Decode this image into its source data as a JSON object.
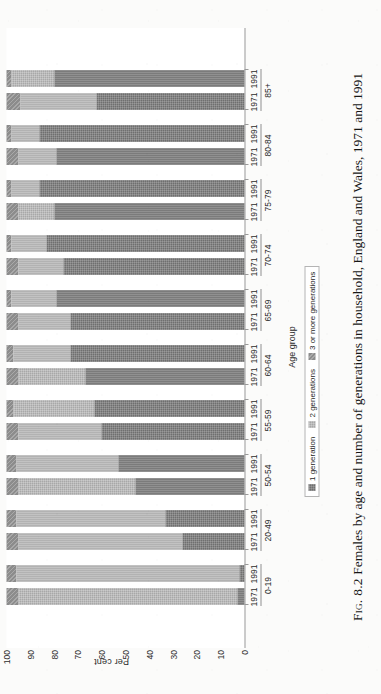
{
  "figure": {
    "label": "Fig. 8.2",
    "caption": "Females by age and number of generations in household, England and Wales, 1971 and 1991"
  },
  "axes": {
    "ylabel": "Per cent",
    "xlabel": "Age group",
    "yticks": [
      "100",
      "90",
      "80",
      "70",
      "60",
      "50",
      "40",
      "30",
      "20",
      "10",
      "0"
    ]
  },
  "legend": {
    "items": [
      {
        "label": "1 generation",
        "color": "#6f6f6f"
      },
      {
        "label": "2 generations",
        "color": "#a8a8a8"
      },
      {
        "label": "3 or more generations",
        "color": "#8c8c8c"
      }
    ]
  },
  "chart_data": {
    "type": "bar",
    "subtype": "stacked-100-percent",
    "title": "Females by age and number of generations in household, England and Wales, 1971 and 1991",
    "xlabel": "Age group",
    "ylabel": "Per cent",
    "ylim": [
      0,
      100
    ],
    "grid": false,
    "legend_position": "below-axis",
    "categories": [
      "0-19",
      "20-49",
      "50-54",
      "55-59",
      "60-64",
      "65-69",
      "70-74",
      "75-79",
      "80-84",
      "85+"
    ],
    "subcategories": [
      "1971",
      "1991"
    ],
    "series": [
      {
        "name": "1 generation",
        "color": "#6f6f6f",
        "values_1971": [
          3,
          26,
          46,
          60,
          67,
          73,
          76,
          80,
          79,
          62
        ],
        "values_1991": [
          2,
          33,
          53,
          63,
          73,
          79,
          83,
          86,
          86,
          80
        ]
      },
      {
        "name": "2 generations",
        "color": "#a8a8a8",
        "values_1971": [
          92,
          69,
          49,
          35,
          28,
          22,
          19,
          15,
          16,
          32
        ],
        "values_1991": [
          94,
          63,
          43,
          34,
          24,
          19,
          15,
          12,
          12,
          18
        ]
      },
      {
        "name": "3 or more generations",
        "color": "#8c8c8c",
        "values_1971": [
          5,
          5,
          5,
          5,
          5,
          5,
          5,
          5,
          5,
          6
        ],
        "values_1991": [
          4,
          4,
          4,
          3,
          3,
          2,
          2,
          2,
          2,
          2
        ]
      }
    ],
    "bars": [
      {
        "group": "0-19",
        "year": "1971",
        "seg1": 3,
        "seg2": 92,
        "seg3": 5
      },
      {
        "group": "0-19",
        "year": "1991",
        "seg1": 2,
        "seg2": 94,
        "seg3": 4
      },
      {
        "group": "20-49",
        "year": "1971",
        "seg1": 26,
        "seg2": 69,
        "seg3": 5
      },
      {
        "group": "20-49",
        "year": "1991",
        "seg1": 33,
        "seg2": 63,
        "seg3": 4
      },
      {
        "group": "50-54",
        "year": "1971",
        "seg1": 46,
        "seg2": 49,
        "seg3": 5
      },
      {
        "group": "50-54",
        "year": "1991",
        "seg1": 53,
        "seg2": 43,
        "seg3": 4
      },
      {
        "group": "55-59",
        "year": "1971",
        "seg1": 60,
        "seg2": 35,
        "seg3": 5
      },
      {
        "group": "55-59",
        "year": "1991",
        "seg1": 63,
        "seg2": 34,
        "seg3": 3
      },
      {
        "group": "60-64",
        "year": "1971",
        "seg1": 67,
        "seg2": 28,
        "seg3": 5
      },
      {
        "group": "60-64",
        "year": "1991",
        "seg1": 73,
        "seg2": 24,
        "seg3": 3
      },
      {
        "group": "65-69",
        "year": "1971",
        "seg1": 73,
        "seg2": 22,
        "seg3": 5
      },
      {
        "group": "65-69",
        "year": "1991",
        "seg1": 79,
        "seg2": 19,
        "seg3": 2
      },
      {
        "group": "70-74",
        "year": "1971",
        "seg1": 76,
        "seg2": 19,
        "seg3": 5
      },
      {
        "group": "70-74",
        "year": "1991",
        "seg1": 83,
        "seg2": 15,
        "seg3": 2
      },
      {
        "group": "75-79",
        "year": "1971",
        "seg1": 80,
        "seg2": 15,
        "seg3": 5
      },
      {
        "group": "75-79",
        "year": "1991",
        "seg1": 86,
        "seg2": 12,
        "seg3": 2
      },
      {
        "group": "80-84",
        "year": "1971",
        "seg1": 79,
        "seg2": 16,
        "seg3": 5
      },
      {
        "group": "80-84",
        "year": "1991",
        "seg1": 86,
        "seg2": 12,
        "seg3": 2
      },
      {
        "group": "85+",
        "year": "1971",
        "seg1": 62,
        "seg2": 32,
        "seg3": 6
      },
      {
        "group": "85+",
        "year": "1991",
        "seg1": 80,
        "seg2": 18,
        "seg3": 2
      }
    ]
  }
}
